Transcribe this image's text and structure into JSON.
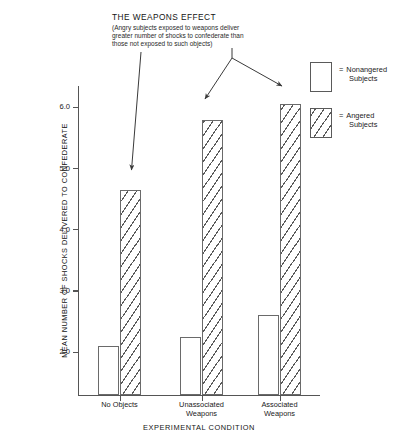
{
  "caption": {
    "title": "THE WEAPONS EFFECT",
    "line1": "(Angry subjects exposed to weapons deliver",
    "line2": "greater number of shocks to confederate than",
    "line3": "those not exposed to such objects)"
  },
  "legend": {
    "equals": "=",
    "items": [
      {
        "label_line1": "Nonangered",
        "label_line2": "Subjects",
        "pattern": "solid-white"
      },
      {
        "label_line1": "Angered",
        "label_line2": "Subjects",
        "pattern": "diagonal-hatch"
      }
    ]
  },
  "chart_data": {
    "type": "bar",
    "title": "THE WEAPONS EFFECT",
    "xlabel": "EXPERIMENTAL CONDITION",
    "ylabel": "MEAN NUMBER OF SHOCKS DELIVERED TO CONFEDERATE",
    "categories": [
      "No Objects",
      "Unassociated Weapons",
      "Associated Weapons"
    ],
    "category_lines": [
      [
        "No Objects",
        ""
      ],
      [
        "Unassociated",
        "Weapons"
      ],
      [
        "Associated",
        "Weapons"
      ]
    ],
    "series": [
      {
        "name": "Nonangered Subjects",
        "values": [
          2.1,
          2.25,
          2.6
        ]
      },
      {
        "name": "Angered Subjects",
        "values": [
          4.65,
          5.8,
          6.05
        ]
      }
    ],
    "ylim": [
      1.3,
      6.35
    ],
    "yticks": [
      2.0,
      3.0,
      4.0,
      5.0,
      6.0
    ],
    "ytick_labels": [
      "2.0",
      "3.0",
      "4.0",
      "5.0",
      "6.0"
    ],
    "grid": false,
    "legend_position": "right-top"
  },
  "annotations": [
    {
      "name": "arrow-to-angered-no-objects",
      "target": "No Objects / Angered"
    },
    {
      "name": "arrow-to-angered-unassociated",
      "target": "Unassociated Weapons / Angered"
    },
    {
      "name": "arrow-to-angered-associated",
      "target": "Associated Weapons / Angered"
    }
  ]
}
